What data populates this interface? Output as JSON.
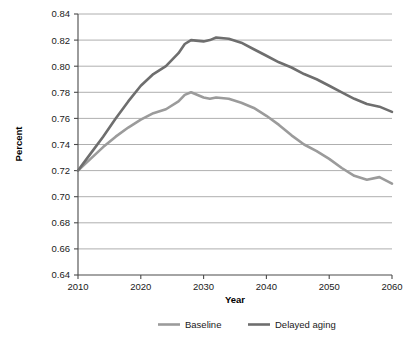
{
  "chart_data": {
    "type": "line",
    "title": "",
    "xlabel": "Year",
    "ylabel": "Percent",
    "xlim": [
      2010,
      2060
    ],
    "ylim": [
      0.64,
      0.84
    ],
    "grid": true,
    "legend_position": "bottom",
    "x_ticks": [
      "2010",
      "2020",
      "2030",
      "2040",
      "2050",
      "2060"
    ],
    "x_tick_values": [
      2010,
      2020,
      2030,
      2040,
      2050,
      2060
    ],
    "y_ticks": [
      "0.64",
      "0.66",
      "0.68",
      "0.70",
      "0.72",
      "0.74",
      "0.76",
      "0.78",
      "0.80",
      "0.82",
      "0.84"
    ],
    "y_tick_values": [
      0.64,
      0.66,
      0.68,
      0.7,
      0.72,
      0.74,
      0.76,
      0.78,
      0.8,
      0.82,
      0.84
    ],
    "x": [
      2010,
      2012,
      2014,
      2016,
      2018,
      2020,
      2022,
      2024,
      2026,
      2027,
      2028,
      2030,
      2031,
      2032,
      2034,
      2036,
      2038,
      2040,
      2042,
      2044,
      2046,
      2048,
      2050,
      2052,
      2054,
      2056,
      2058,
      2060
    ],
    "series": [
      {
        "name": "Baseline",
        "color": "#9b9b9b",
        "values": [
          0.72,
          0.729,
          0.738,
          0.746,
          0.753,
          0.759,
          0.764,
          0.767,
          0.773,
          0.778,
          0.78,
          0.776,
          0.775,
          0.776,
          0.775,
          0.772,
          0.768,
          0.762,
          0.755,
          0.747,
          0.74,
          0.735,
          0.729,
          0.722,
          0.716,
          0.713,
          0.715,
          0.71
        ]
      },
      {
        "name": "Delayed aging",
        "color": "#6e6e6e",
        "values": [
          0.72,
          0.733,
          0.746,
          0.76,
          0.773,
          0.785,
          0.794,
          0.8,
          0.81,
          0.817,
          0.82,
          0.819,
          0.82,
          0.822,
          0.821,
          0.818,
          0.813,
          0.808,
          0.803,
          0.799,
          0.794,
          0.79,
          0.785,
          0.78,
          0.775,
          0.771,
          0.769,
          0.765
        ]
      }
    ]
  },
  "legend": {
    "items": [
      {
        "label": "Baseline",
        "color": "#9b9b9b"
      },
      {
        "label": "Delayed aging",
        "color": "#6e6e6e"
      }
    ]
  }
}
